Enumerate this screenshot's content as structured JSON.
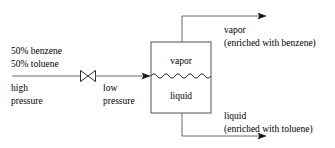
{
  "diagram": {
    "stroke_color": "#3c3c3c",
    "vessel_stroke_color": "#4a4a4a",
    "text_color": "#000000",
    "feed": {
      "composition_line1": "50% benzene",
      "composition_line2": "50% toluene",
      "pressure_line1": "high",
      "pressure_line2": "pressure"
    },
    "valve": {
      "name": "throttling-valve",
      "outlet_line1": "low",
      "outlet_line2": "pressure"
    },
    "vessel": {
      "name": "flash-drum",
      "top_phase_label": "vapor",
      "bottom_phase_label": "liquid",
      "interface": "wavy-line"
    },
    "products": {
      "vapor_line1": "vapor",
      "vapor_line2": "(enriched with benzene)",
      "liquid_line1": "liquid",
      "liquid_line2": "(enriched with toluene)"
    }
  }
}
